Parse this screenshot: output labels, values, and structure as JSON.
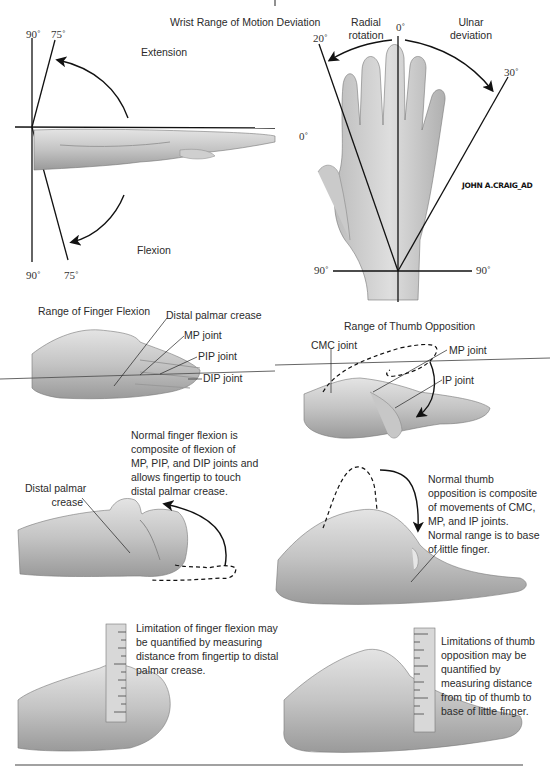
{
  "figure": {
    "signature": "JOHN A.CRAIG_AD",
    "colors": {
      "line": "#111111",
      "skin_light": "#d9d9d9",
      "skin_mid": "#b5b5b5",
      "skin_dark": "#8a8a8a",
      "text": "#2b2b2b",
      "rule": "#666666"
    }
  },
  "wrist_flexion_extension": {
    "title": "Wrist Range of Motion Deviation",
    "extension_label": "Extension",
    "flexion_label": "Flexion",
    "angles": {
      "top_90": "90˚",
      "top_75": "75˚",
      "zero": "0˚",
      "bottom_90": "90˚",
      "bottom_75": "75˚"
    }
  },
  "wrist_deviation": {
    "radial_label_1": "Radial",
    "radial_label_2": "rotation",
    "ulnar_label_1": "Ulnar",
    "ulnar_label_2": "deviation",
    "angles": {
      "zero": "0˚",
      "radial_20": "20˚",
      "ulnar_30": "30˚",
      "left_90": "90˚",
      "right_90": "90˚"
    }
  },
  "finger_flexion": {
    "title": "Range of Finger Flexion",
    "labels": [
      "Distal palmar crease",
      "MP joint",
      "PIP joint",
      "DIP joint"
    ],
    "description": [
      "Normal finger flexion is",
      "composite of flexion of",
      "MP, PIP, and DIP joints and",
      "allows fingertip to touch",
      "distal palmar crease."
    ],
    "crease_label": [
      "Distal palmar",
      "crease"
    ],
    "measure_text": [
      "Limitation of finger flexion may",
      "be quantified by measuring",
      "distance from fingertip to distal",
      "palmar crease."
    ]
  },
  "thumb_opposition": {
    "title": "Range of Thumb Opposition",
    "labels": [
      "CMC joint",
      "MP joint",
      "IP joint"
    ],
    "description": [
      "Normal thumb",
      "opposition is composite",
      "of movements of CMC,",
      "MP, and IP joints.",
      "Normal range is to base",
      "of little finger."
    ],
    "measure_text": [
      "Limitations of thumb",
      "opposition may be",
      "quantified by",
      "measuring distance",
      "from tip of thumb to",
      "base of little finger."
    ]
  }
}
